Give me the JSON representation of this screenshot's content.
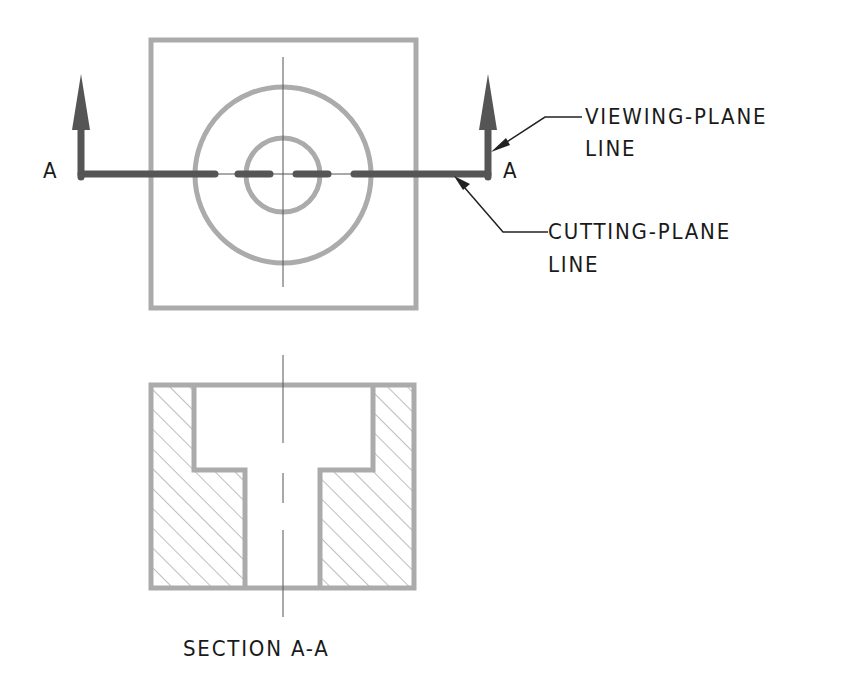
{
  "drawing": {
    "type": "section-view-illustration",
    "top_view": {
      "label_left": "A",
      "label_right": "A"
    },
    "callouts": [
      {
        "id": "viewing-plane",
        "line1": "VIEWING-PLANE",
        "line2": "LINE"
      },
      {
        "id": "cutting-plane",
        "line1": "CUTTING-PLANE",
        "line2": "LINE"
      }
    ],
    "section_view": {
      "caption": "SECTION A-A"
    },
    "colors": {
      "object_line": "#aaaaaa",
      "cutting_plane": "#555555",
      "center_line": "#444444",
      "hatch": "#999999",
      "text": "#1a1a1a"
    }
  }
}
